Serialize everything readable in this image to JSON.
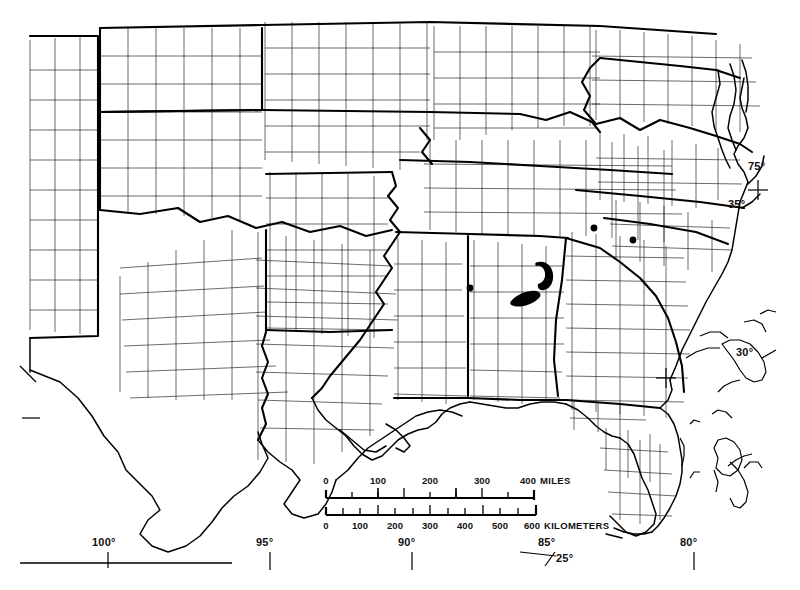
{
  "map": {
    "title": "County outline map of the southeastern and south-central United States",
    "style": "black-and-white line map, county boundaries, heavier state boundaries",
    "background_color": "#ffffff",
    "line_color": "#000000",
    "marker_color": "#000000",
    "frame": {
      "bottom_rule_present": true
    },
    "graticule_labels": [
      {
        "text": "100°",
        "type": "longitude",
        "x": 100,
        "y": 543
      },
      {
        "text": "95°",
        "type": "longitude",
        "x": 262,
        "y": 543
      },
      {
        "text": "90°",
        "type": "longitude",
        "x": 405,
        "y": 543
      },
      {
        "text": "85°",
        "type": "longitude",
        "x": 545,
        "y": 543
      },
      {
        "text": "80°",
        "type": "longitude",
        "x": 686,
        "y": 543
      },
      {
        "text": "75°",
        "type": "latitude-corner",
        "x": 752,
        "y": 167
      },
      {
        "text": "35°",
        "type": "latitude",
        "x": 733,
        "y": 205
      },
      {
        "text": "30°",
        "type": "latitude",
        "x": 741,
        "y": 352
      },
      {
        "text": "25°",
        "type": "latitude",
        "x": 556,
        "y": 559
      }
    ],
    "scale_bar": {
      "miles": {
        "unit_label": "MILES",
        "ticks": [
          "0",
          "100",
          "200",
          "300",
          "400"
        ],
        "max": 400
      },
      "kilometers": {
        "unit_label": "KILOMETERS",
        "ticks": [
          "0",
          "100",
          "200",
          "300",
          "400",
          "500",
          "600"
        ],
        "max": 600
      }
    },
    "occurrence_markers": {
      "count": 6,
      "dots": [
        {
          "name": "marker-mississippi-1",
          "x": 470,
          "y": 288,
          "r": 3.4
        },
        {
          "name": "marker-georgia-1",
          "x": 594,
          "y": 228,
          "r": 3.4
        },
        {
          "name": "marker-south-carolina-1",
          "x": 633,
          "y": 240,
          "r": 3.4
        }
      ],
      "blobs": [
        {
          "name": "marker-alabama-upper-crescent",
          "x": 545,
          "y": 273
        },
        {
          "name": "marker-alabama-lower-band",
          "x": 524,
          "y": 297
        }
      ]
    }
  }
}
